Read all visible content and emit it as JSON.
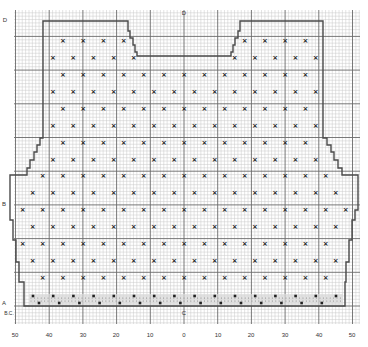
{
  "diagram": {
    "type": "knitting-chart",
    "grid": {
      "left": 14,
      "top": 10,
      "right": 360,
      "bottom": 324,
      "cell": 3.37,
      "major_every": 10,
      "minor_color": "#c9c9c9",
      "major_color": "#6a6a6a"
    },
    "outline_color": "#4a4a4a",
    "outline": [
      [
        43,
        21
      ],
      [
        128,
        21
      ],
      [
        128,
        31
      ],
      [
        130,
        31
      ],
      [
        130,
        38
      ],
      [
        133,
        38
      ],
      [
        133,
        45
      ],
      [
        135,
        45
      ],
      [
        135,
        52
      ],
      [
        137,
        52
      ],
      [
        137,
        56
      ],
      [
        231,
        56
      ],
      [
        231,
        52
      ],
      [
        233,
        52
      ],
      [
        233,
        45
      ],
      [
        235,
        45
      ],
      [
        235,
        38
      ],
      [
        238,
        38
      ],
      [
        238,
        31
      ],
      [
        240,
        31
      ],
      [
        240,
        21
      ],
      [
        323,
        21
      ],
      [
        323,
        138
      ],
      [
        327,
        138
      ],
      [
        327,
        145
      ],
      [
        331,
        145
      ],
      [
        331,
        152
      ],
      [
        334,
        152
      ],
      [
        334,
        160
      ],
      [
        338,
        160
      ],
      [
        338,
        168
      ],
      [
        342,
        168
      ],
      [
        342,
        175
      ],
      [
        358,
        175
      ],
      [
        358,
        210
      ],
      [
        355,
        210
      ],
      [
        355,
        220
      ],
      [
        352,
        220
      ],
      [
        352,
        240
      ],
      [
        349,
        240
      ],
      [
        349,
        262
      ],
      [
        346,
        262
      ],
      [
        346,
        282
      ],
      [
        345,
        282
      ],
      [
        345,
        306
      ],
      [
        24,
        306
      ],
      [
        24,
        282
      ],
      [
        19,
        282
      ],
      [
        19,
        262
      ],
      [
        16,
        262
      ],
      [
        16,
        240
      ],
      [
        13,
        240
      ],
      [
        13,
        220
      ],
      [
        10,
        220
      ],
      [
        10,
        210
      ],
      [
        10,
        175
      ],
      [
        27,
        175
      ],
      [
        27,
        168
      ],
      [
        30,
        168
      ],
      [
        30,
        160
      ],
      [
        34,
        160
      ],
      [
        34,
        152
      ],
      [
        37,
        152
      ],
      [
        37,
        145
      ],
      [
        40,
        145
      ],
      [
        40,
        138
      ],
      [
        43,
        138
      ],
      [
        43,
        21
      ]
    ],
    "ribbing": {
      "x1": 29,
      "x2": 343,
      "y1": 294,
      "y2": 306,
      "fill": "#d8d8d8",
      "rows_y": [
        296,
        303
      ]
    },
    "motif": {
      "symbol": "×",
      "color": "#222222",
      "row_start_y": 41,
      "row_step": 16.9,
      "rows": 15,
      "col_step": 20.2,
      "odd_x0": 63,
      "even_x0": 53,
      "bounds_note": "marks placed inside outline"
    },
    "labels": {
      "bottom_axis": [
        "50",
        "40",
        "30",
        "20",
        "10",
        "0",
        "10",
        "20",
        "30",
        "40",
        "50"
      ],
      "bottom_axis_x": [
        15,
        49,
        83,
        116,
        150,
        184,
        218,
        251,
        285,
        319,
        352
      ],
      "bottom_axis_y": 335,
      "top_center": "D",
      "left_top": "D",
      "left_mid": "B",
      "left_bottom_a": "A",
      "left_bottom_b": "B.C.",
      "center_bottom": "C"
    }
  }
}
